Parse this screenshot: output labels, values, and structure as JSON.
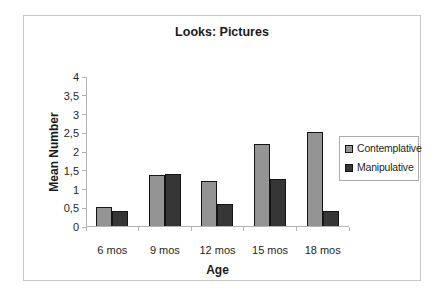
{
  "chart_data": {
    "type": "bar",
    "title": "Looks: Pictures",
    "xlabel": "Age",
    "ylabel": "Mean Number",
    "categories": [
      "6 mos",
      "9 mos",
      "12 mos",
      "15 mos",
      "18 mos"
    ],
    "series": [
      {
        "name": "Contemplative",
        "color": "#949494",
        "values": [
          0.5,
          1.35,
          1.2,
          2.2,
          2.5
        ]
      },
      {
        "name": "Manipulative",
        "color": "#363636",
        "values": [
          0.4,
          1.4,
          0.6,
          1.25,
          0.4
        ]
      }
    ],
    "ylim": [
      0,
      4
    ],
    "ytick_step": 0.5,
    "y_tick_labels_bottom_up": [
      "0",
      "0,5",
      "1",
      "1,5",
      "2",
      "2,5",
      "3",
      "3,5",
      "4"
    ],
    "decimal_separator": ",",
    "grid": false,
    "legend_position": "right",
    "colors": {
      "axis_line": "#b3b3b3",
      "bar_border": "#141414",
      "frame_border": "#c9c9c9",
      "text": "#262626"
    }
  }
}
